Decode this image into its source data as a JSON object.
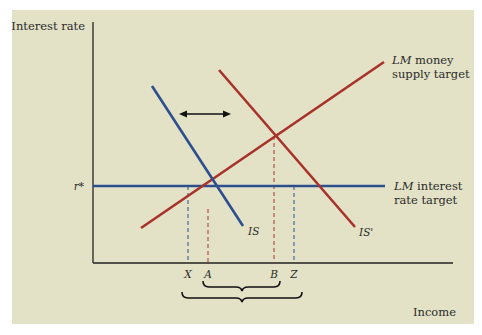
{
  "diagram": {
    "background_color": "#e3e2c6",
    "axes": {
      "y_label": "Interest rate",
      "x_label": "Income",
      "r_star_label": "r*"
    },
    "curves": {
      "is": {
        "label": "IS",
        "color": "#2d4f8e"
      },
      "is_prime": {
        "label": "IS'",
        "color": "#a8322a"
      },
      "lm_money": {
        "label_italic": "LM",
        "label_rest_line1": " money",
        "label_line2": "supply target",
        "color": "#a8322a"
      },
      "lm_interest": {
        "label_italic": "LM",
        "label_rest_line1": " interest",
        "label_line2": "rate target",
        "color": "#2d4f8e"
      }
    },
    "x_ticks": [
      "X",
      "A",
      "B",
      "Z"
    ],
    "arrow": "double-headed-horizontal-arrow",
    "braces": [
      "A-B range brace",
      "X-Z range brace"
    ]
  }
}
